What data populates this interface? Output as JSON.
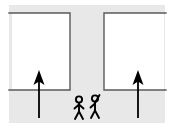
{
  "diagram": {
    "title": "Corridor evacuation schematic",
    "type": "schematic-line-drawing",
    "canvas": {
      "width": 176,
      "height": 128
    },
    "colors": {
      "background": "#ffffff",
      "corridor_fill": "#e8e8e8",
      "room_fill": "#ffffff",
      "wall_stroke": "#5a5a5a",
      "arrow_stroke": "#000000",
      "figure_stroke": "#000000"
    },
    "regions": [
      {
        "name": "corridor",
        "label": "",
        "fill": "#e8e8e8",
        "description": "T-shaped gray passage: horizontal band across the top and a vertical channel down the middle, plus a wide band along the bottom"
      },
      {
        "name": "room-left",
        "label": "",
        "fill": "#ffffff",
        "bounds": {
          "x": 12,
          "y": 13,
          "width": 58,
          "height": 77
        }
      },
      {
        "name": "room-right",
        "label": "",
        "fill": "#ffffff",
        "bounds": {
          "x": 104,
          "y": 13,
          "width": 60,
          "height": 77
        }
      }
    ],
    "walls": [
      {
        "name": "wall-top-left",
        "x1": 12,
        "y1": 13,
        "x2": 70,
        "y2": 13
      },
      {
        "name": "wall-left-channel",
        "x1": 70,
        "y1": 13,
        "x2": 70,
        "y2": 90
      },
      {
        "name": "wall-bottom-left",
        "x1": 12,
        "y1": 90,
        "x2": 70,
        "y2": 90
      },
      {
        "name": "wall-top-right",
        "x1": 104,
        "y1": 13,
        "x2": 164,
        "y2": 13
      },
      {
        "name": "wall-right-channel",
        "x1": 104,
        "y1": 13,
        "x2": 104,
        "y2": 90
      },
      {
        "name": "wall-bottom-right",
        "x1": 104,
        "y1": 90,
        "x2": 164,
        "y2": 90
      }
    ],
    "arrows": [
      {
        "name": "arrow-left",
        "direction": "up",
        "x": 39,
        "tail_y": 118,
        "head_y": 72,
        "label": ""
      },
      {
        "name": "arrow-right",
        "direction": "up",
        "x": 138,
        "tail_y": 118,
        "head_y": 72,
        "label": ""
      }
    ],
    "figures": [
      {
        "name": "person-left",
        "label": "",
        "x": 79,
        "head_y": 99,
        "pose": "arms-down"
      },
      {
        "name": "person-right",
        "label": "",
        "x": 95,
        "head_y": 97,
        "pose": "right-arm-raised"
      }
    ]
  }
}
